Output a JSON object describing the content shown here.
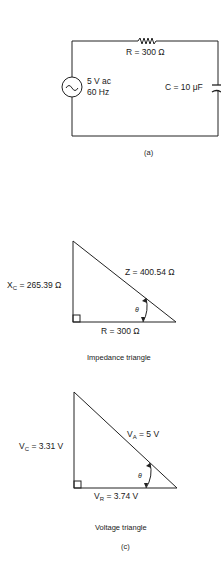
{
  "figure_a": {
    "resistor_label": "R = 300 Ω",
    "source_line1": "5 V ac",
    "source_line2": "60 Hz",
    "capacitor_label": "C = 10 μF",
    "caption": "(a)"
  },
  "impedance_triangle": {
    "xc_symbol": "X",
    "xc_sub": "C",
    "xc_value": " = 265.39 Ω",
    "hypotenuse_label": "Z = 400.54 Ω",
    "base_label": "R = 300 Ω",
    "angle_label": "θ",
    "title": "Impedance triangle"
  },
  "voltage_triangle": {
    "vc_symbol": "V",
    "vc_sub": "C",
    "vc_value": " = 3.31 V",
    "va_symbol": "V",
    "va_sub": "A",
    "va_value": " = 5 V",
    "vr_symbol": "V",
    "vr_sub": "R",
    "vr_value": " = 3.74 V",
    "angle_label": "θ",
    "title": "Voltage triangle"
  },
  "figure_caption": "(c)"
}
